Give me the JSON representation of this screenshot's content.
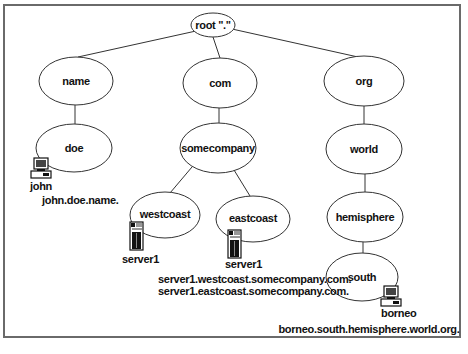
{
  "diagram": {
    "nodes": {
      "root": "root \".\"",
      "name": "name",
      "com": "com",
      "org": "org",
      "doe": "doe",
      "somecompany": "somecompany",
      "world": "world",
      "westcoast": "westcoast",
      "eastcoast": "eastcoast",
      "hemisphere": "hemisphere",
      "south": "south"
    },
    "hosts": {
      "john": "john",
      "server1_west": "server1",
      "server1_east": "server1",
      "borneo": "borneo"
    },
    "fqdns": {
      "john": "john.doe.name.",
      "server1_west": "server1.westcoast.somecompany.com.",
      "server1_east": "server1.eastcoast.somecompany.com.",
      "borneo": "borneo.south.hemisphere.world.org."
    },
    "icons": {
      "john": "desktop-computer-icon",
      "server1_west": "server-tower-icon",
      "server1_east": "server-tower-icon",
      "borneo": "desktop-computer-icon"
    }
  }
}
